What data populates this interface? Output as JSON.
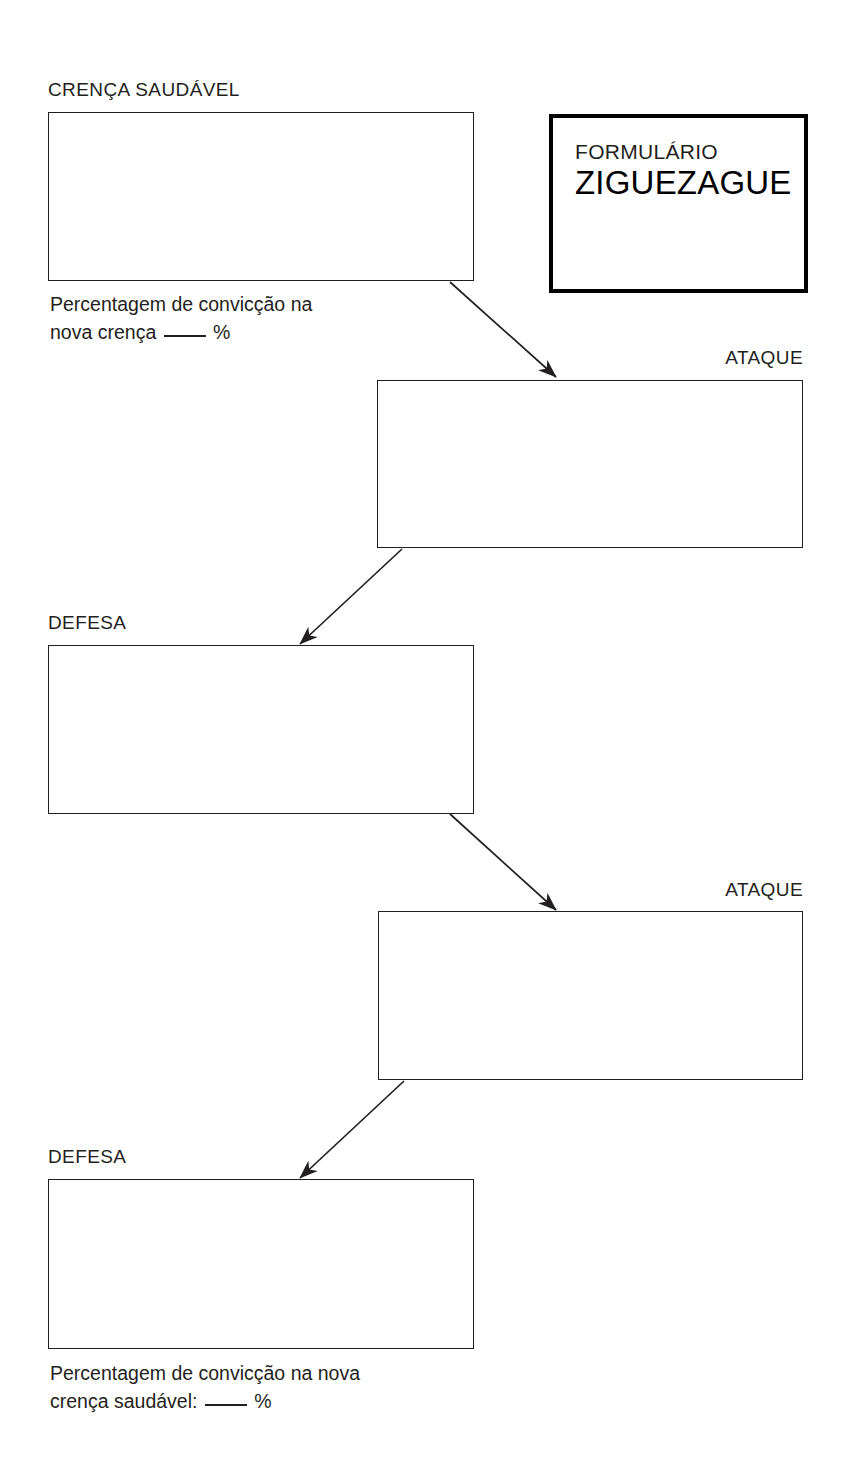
{
  "document": {
    "title": "Formulário Ziguezague",
    "language": "pt-PT",
    "ink_color": "#231f20",
    "page_background": "#ffffff"
  },
  "title_card": {
    "line1": "FORMULÁRIO",
    "line2": "ZIGUEZAGUE",
    "border_color": "#000000"
  },
  "labels": {
    "healthy_belief": "CRENÇA SAUDÁVEL",
    "attack_1": "ATAQUE",
    "defense_1": "DEFESA",
    "attack_2": "ATAQUE",
    "defense_2": "DEFESA"
  },
  "captions": {
    "top": {
      "line1": "Percentagem de convicção na",
      "line2_before_blank": "nova crença",
      "line2_after_blank": "%"
    },
    "bottom": {
      "line1": "Percentagem de convicção na nova",
      "line2_before_blank": "crença saudável:",
      "line2_after_blank": "%"
    }
  },
  "write_boxes": [
    {
      "name": "healthy-belief-box",
      "label": "CRENÇA SAUDÁVEL",
      "value": ""
    },
    {
      "name": "attack-box-1",
      "label": "ATAQUE",
      "value": ""
    },
    {
      "name": "defense-box-1",
      "label": "DEFESA",
      "value": ""
    },
    {
      "name": "attack-box-2",
      "label": "ATAQUE",
      "value": ""
    },
    {
      "name": "defense-box-2",
      "label": "DEFESA",
      "value": ""
    }
  ],
  "flow": {
    "direction": "zigzag-downward",
    "sequence": [
      "CRENÇA SAUDÁVEL",
      "ATAQUE",
      "DEFESA",
      "ATAQUE",
      "DEFESA"
    ],
    "arrow_count": 4
  }
}
